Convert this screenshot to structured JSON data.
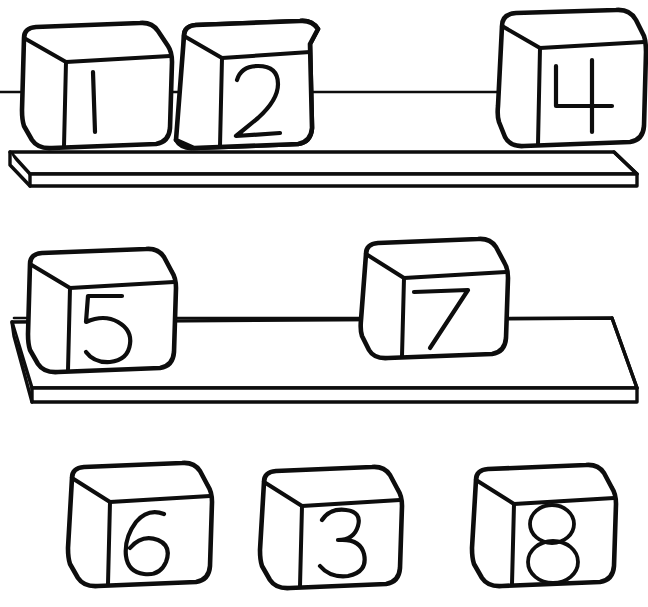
{
  "figure": {
    "title": "Numbered cubes on shelves",
    "style": "hand-drawn black line art on white",
    "width": 648,
    "height": 607,
    "ink_color": "#0d0d0d",
    "background_color": "#ffffff"
  },
  "rows": [
    {
      "id": "row-top",
      "name": "top-shelf-row",
      "has_shelf": true,
      "connector_y": 92,
      "connector_label": "horizontal line linking cube 1, cube 2 and cube 4",
      "cubes": [
        {
          "label": "1",
          "name": "cube-one",
          "x": 22,
          "y": 24,
          "size": 128,
          "on_shelf": true
        },
        {
          "label": "2",
          "name": "cube-two",
          "x": 180,
          "y": 20,
          "size": 128,
          "on_shelf": true
        },
        {
          "label": "4",
          "name": "cube-four",
          "x": 494,
          "y": 10,
          "size": 132,
          "on_shelf": true
        }
      ]
    },
    {
      "id": "row-middle",
      "name": "bottom-shelf-row",
      "has_shelf": true,
      "connector_y": 318,
      "connector_label": "horizontal line linking cube 5 and cube 7",
      "cubes": [
        {
          "label": "5",
          "name": "cube-five",
          "x": 28,
          "y": 250,
          "size": 128,
          "on_shelf": true
        },
        {
          "label": "7",
          "name": "cube-seven",
          "x": 360,
          "y": 240,
          "size": 132,
          "on_shelf": false
        }
      ]
    },
    {
      "id": "row-loose",
      "name": "loose-cubes-row",
      "has_shelf": false,
      "connector_y": null,
      "connector_label": "",
      "cubes": [
        {
          "label": "6",
          "name": "cube-six",
          "x": 70,
          "y": 462,
          "size": 126,
          "on_shelf": false
        },
        {
          "label": "3",
          "name": "cube-three",
          "x": 262,
          "y": 466,
          "size": 124,
          "on_shelf": false
        },
        {
          "label": "8",
          "name": "cube-eight",
          "x": 474,
          "y": 466,
          "size": 126,
          "on_shelf": false
        }
      ]
    }
  ],
  "shelves": [
    {
      "name": "shelf-top",
      "label": "upper shelf",
      "y": 148
    },
    {
      "name": "shelf-bottom",
      "label": "lower shelf",
      "y": 318
    }
  ],
  "labels": {
    "cube_1": "1",
    "cube_2": "2",
    "cube_3": "3",
    "cube_4": "4",
    "cube_5": "5",
    "cube_6": "6",
    "cube_7": "7",
    "cube_8": "8"
  },
  "accessible": {
    "summary": "Hand drawn diagram of eight numbered cubes. Cubes 1, 2 and 4 rest on an upper shelf joined by a horizontal line. Cubes 5 and 7 sit at a lower shelf joined by a horizontal line, with cube 7 raised slightly above the shelf surface. Cubes 6, 3 and 8 rest loose along the bottom with no shelf."
  }
}
